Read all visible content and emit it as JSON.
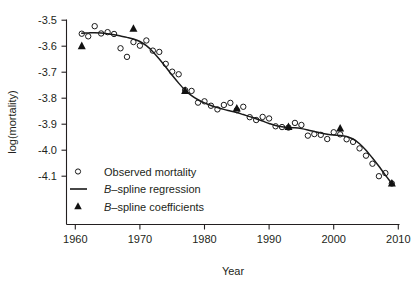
{
  "chart_data": {
    "type": "scatter",
    "title": "",
    "xlabel": "Year",
    "ylabel": "log(mortality)",
    "xlim": [
      1959,
      2010.5
    ],
    "ylim": [
      -4.15,
      -3.47
    ],
    "grid": false,
    "x_ticks": [
      1960,
      1970,
      1980,
      1990,
      2000,
      2010
    ],
    "x_tick_labels": [
      "1960",
      "1970",
      "1980",
      "1990",
      "2000",
      "2010"
    ],
    "y_ticks": [
      -3.5,
      -3.6,
      -3.7,
      -3.8,
      -3.9,
      -4.0,
      -4.1
    ],
    "y_tick_labels": [
      "-3.5",
      "-3.6",
      "-3.7",
      "-3.8",
      "-3.9",
      "-4.0",
      "-4.1"
    ],
    "legend_position": "bottom-left",
    "series": [
      {
        "name": "Observed mortality",
        "type": "scatter",
        "marker": "open-circle",
        "x": [
          1961,
          1962,
          1963,
          1964,
          1965,
          1966,
          1967,
          1968,
          1969,
          1970,
          1971,
          1972,
          1973,
          1974,
          1975,
          1976,
          1977,
          1978,
          1979,
          1980,
          1981,
          1982,
          1983,
          1984,
          1985,
          1986,
          1987,
          1988,
          1989,
          1990,
          1991,
          1992,
          1993,
          1994,
          1995,
          1996,
          1997,
          1998,
          1999,
          2000,
          2001,
          2002,
          2003,
          2004,
          2005,
          2006,
          2007,
          2008,
          2009
        ],
        "y": [
          -3.552,
          -3.562,
          -3.523,
          -3.551,
          -3.546,
          -3.553,
          -3.608,
          -3.641,
          -3.584,
          -3.598,
          -3.578,
          -3.617,
          -3.622,
          -3.668,
          -3.698,
          -3.708,
          -3.769,
          -3.772,
          -3.817,
          -3.812,
          -3.829,
          -3.843,
          -3.826,
          -3.818,
          -3.846,
          -3.833,
          -3.873,
          -3.884,
          -3.872,
          -3.878,
          -3.908,
          -3.911,
          -3.913,
          -3.895,
          -3.903,
          -3.944,
          -3.938,
          -3.941,
          -3.957,
          -3.931,
          -3.939,
          -3.958,
          -3.968,
          -3.993,
          -4.021,
          -4.052,
          -4.1,
          -4.088,
          -4.128
        ]
      },
      {
        "name": "B-spline regression",
        "type": "line",
        "x": [
          1961,
          1962,
          1963,
          1964,
          1965,
          1966,
          1967,
          1968,
          1969,
          1970,
          1971,
          1972,
          1973,
          1974,
          1975,
          1976,
          1977,
          1978,
          1979,
          1980,
          1981,
          1982,
          1983,
          1984,
          1985,
          1986,
          1987,
          1988,
          1989,
          1990,
          1991,
          1992,
          1993,
          1994,
          1995,
          1996,
          1997,
          1998,
          1999,
          2000,
          2001,
          2002,
          2003,
          2004,
          2005,
          2006,
          2007,
          2008,
          2009
        ],
        "y": [
          -3.55,
          -3.549,
          -3.548,
          -3.549,
          -3.552,
          -3.556,
          -3.561,
          -3.566,
          -3.572,
          -3.582,
          -3.598,
          -3.621,
          -3.649,
          -3.68,
          -3.712,
          -3.742,
          -3.769,
          -3.79,
          -3.806,
          -3.818,
          -3.828,
          -3.836,
          -3.843,
          -3.849,
          -3.855,
          -3.863,
          -3.871,
          -3.879,
          -3.888,
          -3.897,
          -3.905,
          -3.91,
          -3.913,
          -3.914,
          -3.917,
          -3.922,
          -3.928,
          -3.934,
          -3.939,
          -3.942,
          -3.943,
          -3.947,
          -3.957,
          -3.975,
          -4.0,
          -4.03,
          -4.062,
          -4.096,
          -4.128
        ]
      },
      {
        "name": "B-spline coefficients",
        "type": "scatter",
        "marker": "filled-triangle",
        "x": [
          1961,
          1969,
          1977,
          1985,
          1993,
          2001,
          2009
        ],
        "y": [
          -3.6,
          -3.533,
          -3.772,
          -3.84,
          -3.911,
          -3.917,
          -4.128
        ]
      }
    ]
  },
  "legend": {
    "items": [
      {
        "marker": "open-circle",
        "label_plain": "Observed mortality",
        "label_prefix": "",
        "label_rest": "Observed mortality"
      },
      {
        "marker": "line",
        "label_plain": "B-spline regression",
        "label_prefix": "B",
        "label_rest": "–spline regression"
      },
      {
        "marker": "filled-triangle",
        "label_plain": "B-spline coefficients",
        "label_prefix": "B",
        "label_rest": "–spline coefficients"
      }
    ]
  },
  "colors": {
    "ink": "#231f20",
    "data": "#1a1a1a",
    "background": "#ffffff"
  }
}
